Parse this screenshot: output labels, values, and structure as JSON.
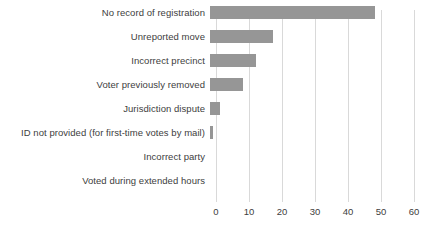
{
  "chart_data": {
    "type": "bar",
    "orientation": "horizontal",
    "title": "",
    "subtitle": "",
    "xlabel": "",
    "ylabel": "",
    "xlim": [
      0,
      60
    ],
    "xticks": [
      "0",
      "10",
      "20",
      "30",
      "40",
      "50",
      "60"
    ],
    "xtick_values": [
      0,
      10,
      20,
      30,
      40,
      50,
      60
    ],
    "grid": "vertical",
    "legend": "none",
    "categories": [
      "No record of registration",
      "Unreported move",
      "Incorrect precinct",
      "Voter previously removed",
      "Jurisdiction dispute",
      "ID not provided (for first-time votes by mail)",
      "Incorrect party",
      "Voted during extended hours"
    ],
    "values": [
      50,
      19,
      14,
      10,
      3,
      1,
      0,
      0
    ],
    "bar_color": "#969696",
    "gridline_color": "#d9d9d9",
    "text_color": "#404040",
    "background_color": "#ffffff"
  }
}
